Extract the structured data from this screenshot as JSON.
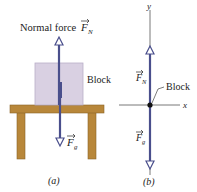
{
  "panel_a": {
    "normal_force_label": "Normal force",
    "normal_force_symbol": "F",
    "normal_force_subscript": "N",
    "block_label": "Block",
    "gravity_symbol": "F",
    "gravity_subscript": "g",
    "caption": "(a)"
  },
  "panel_b": {
    "y_axis_label": "y",
    "x_axis_label": "x",
    "block_label": "Block",
    "normal_symbol": "F",
    "normal_subscript": "N",
    "gravity_symbol": "F",
    "gravity_subscript": "g",
    "caption": "(b)"
  },
  "colors": {
    "arrow": "#4a4f8c",
    "block_fill": "#d9d0e2",
    "block_edge": "#b9aec8",
    "table": "#b8873a",
    "table_edge": "#8a6428",
    "axis": "#555555"
  }
}
